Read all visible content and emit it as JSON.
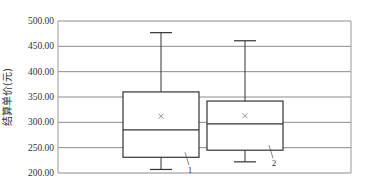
{
  "chart_data": {
    "type": "box",
    "title": "",
    "xlabel": "",
    "ylabel": "结算单价(元)",
    "ylim": [
      200,
      500
    ],
    "yticks": [
      200,
      250,
      300,
      350,
      400,
      450,
      500
    ],
    "ytick_labels": [
      "200.00",
      "250.00",
      "300.00",
      "350.00",
      "400.00",
      "450.00",
      "500.00"
    ],
    "grid": true,
    "legend": "none",
    "series": [
      {
        "name": "1",
        "label": "1",
        "min": 207,
        "q1": 231,
        "median": 285,
        "q3": 360,
        "max": 477,
        "mean": 312
      },
      {
        "name": "2",
        "label": "2",
        "min": 222,
        "q1": 245,
        "median": 297,
        "q3": 342,
        "max": 461,
        "mean": 313
      }
    ],
    "colors": {
      "box": "#333333",
      "grid": "#8c8c8c",
      "axis": "#999999",
      "mean_marker": "#777777"
    }
  }
}
